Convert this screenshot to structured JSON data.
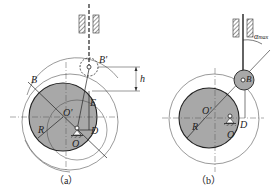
{
  "figure": {
    "panels": [
      {
        "id": "a",
        "caption": "（a）",
        "labels": {
          "B": "B",
          "B_prime": "B'",
          "O_prime": "O'",
          "E": "E",
          "R": "R",
          "D": "D",
          "O": "O",
          "h": "h"
        }
      },
      {
        "id": "b",
        "caption": "（b）",
        "labels": {
          "B": "B",
          "O_prime": "O'",
          "R": "R",
          "D": "D",
          "O": "O",
          "alpha": "α",
          "alpha_sub": "max"
        }
      }
    ],
    "colors": {
      "cam_fill": "#a8a8a8",
      "line": "#333333",
      "background": "#ffffff"
    }
  }
}
